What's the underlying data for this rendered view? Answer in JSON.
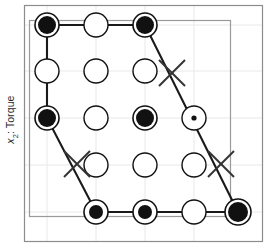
{
  "figure": {
    "axis_label_y_prefix": "x",
    "axis_label_y_sub": "2",
    "axis_label_y_suffix": ": Torque",
    "axis_label_y_full": "x2: Torque"
  },
  "colors": {
    "marker_fill": "#111111",
    "marker_stroke": "#111111",
    "open_marker_fill": "#ffffff",
    "polygon_stroke": "#1a1a1a",
    "grid": "#e8e8e8",
    "inner_frame": "#9a9a9a",
    "outer_frame": "#8c8c8c",
    "background": "#ffffff",
    "cross_stroke": "#333333"
  },
  "frames": {
    "outer": {
      "x": 24,
      "y": 5,
      "width": 238,
      "height": 236
    },
    "inner": {
      "x": 29,
      "y": 20,
      "width": 201,
      "height": 196
    }
  },
  "grid": {
    "columns_x": [
      47,
      96,
      145,
      194
    ],
    "rows_y": [
      25,
      71,
      118,
      165,
      212
    ],
    "show_grid": true
  },
  "chart_data": {
    "type": "scatter",
    "title": "",
    "xlabel": "",
    "ylabel": "x2: Torque",
    "legend": [],
    "markers": [
      {
        "id": "m-r1-c1",
        "x": 47,
        "y": 25,
        "style": "filled-ring",
        "radius": 12,
        "dot_radius": 9
      },
      {
        "id": "m-r1-c2",
        "x": 96,
        "y": 25,
        "style": "open",
        "radius": 12
      },
      {
        "id": "m-r1-c3",
        "x": 145,
        "y": 25,
        "style": "filled-ring",
        "radius": 12,
        "dot_radius": 9
      },
      {
        "id": "m-r2-c1",
        "x": 47,
        "y": 71,
        "style": "open",
        "radius": 12
      },
      {
        "id": "m-r2-c2",
        "x": 96,
        "y": 71,
        "style": "open",
        "radius": 12
      },
      {
        "id": "m-r2-c3",
        "x": 145,
        "y": 71,
        "style": "open",
        "radius": 12
      },
      {
        "id": "m-r3-c1",
        "x": 47,
        "y": 118,
        "style": "filled-ring",
        "radius": 12,
        "dot_radius": 9
      },
      {
        "id": "m-r3-c2",
        "x": 96,
        "y": 118,
        "style": "open",
        "radius": 12
      },
      {
        "id": "m-r3-c3",
        "x": 145,
        "y": 118,
        "style": "filled-ring",
        "radius": 12,
        "dot_radius": 9
      },
      {
        "id": "m-r3-c4",
        "x": 194,
        "y": 118,
        "style": "open-dot",
        "radius": 12,
        "dot_radius": 2.6
      },
      {
        "id": "m-r4-c2",
        "x": 96,
        "y": 165,
        "style": "open",
        "radius": 12
      },
      {
        "id": "m-r4-c3",
        "x": 145,
        "y": 165,
        "style": "open",
        "radius": 12
      },
      {
        "id": "m-r4-c4",
        "x": 194,
        "y": 165,
        "style": "open",
        "radius": 12
      },
      {
        "id": "m-r5-c2",
        "x": 96,
        "y": 212,
        "style": "filled-ring",
        "radius": 12,
        "dot_radius": 7
      },
      {
        "id": "m-r5-c3",
        "x": 145,
        "y": 212,
        "style": "filled-ring",
        "radius": 12,
        "dot_radius": 7
      },
      {
        "id": "m-r5-c4",
        "x": 194,
        "y": 212,
        "style": "open",
        "radius": 12
      },
      {
        "id": "m-r5-c5",
        "x": 238,
        "y": 212,
        "style": "filled-ring",
        "radius": 13,
        "dot_radius": 10
      }
    ],
    "crosses": [
      {
        "id": "x-upper-right",
        "x": 172,
        "y": 73,
        "size": 13
      },
      {
        "id": "x-lower-left",
        "x": 77,
        "y": 164,
        "size": 13
      },
      {
        "id": "x-lower-right",
        "x": 221,
        "y": 164,
        "size": 13
      }
    ],
    "polygon": {
      "closed": true,
      "stroke_width": 2.1,
      "vertices": [
        {
          "x": 47,
          "y": 25
        },
        {
          "x": 145,
          "y": 25
        },
        {
          "x": 238,
          "y": 212
        },
        {
          "x": 145,
          "y": 212
        },
        {
          "x": 96,
          "y": 212
        },
        {
          "x": 47,
          "y": 118
        }
      ]
    }
  }
}
